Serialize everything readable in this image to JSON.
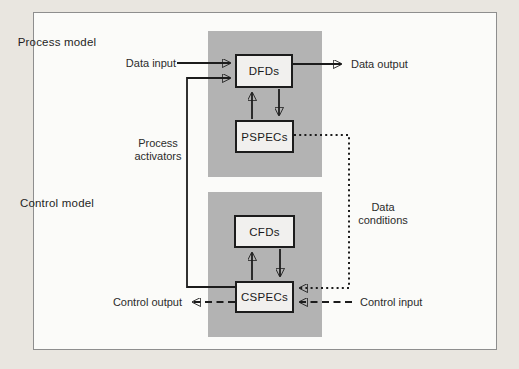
{
  "figure": {
    "type": "block-diagram",
    "panels": [
      {
        "id": "process",
        "title": "Process model",
        "boxes": [
          {
            "id": "dfds",
            "label": "DFDs"
          },
          {
            "id": "pspecs",
            "label": "PSPECs"
          }
        ]
      },
      {
        "id": "control",
        "title": "Control model",
        "boxes": [
          {
            "id": "cfds",
            "label": "CFDs"
          },
          {
            "id": "cspecs",
            "label": "CSPECs"
          }
        ]
      }
    ],
    "flow_labels": {
      "data_input": "Data input",
      "data_output": "Data output",
      "process_activators": "Process\nactivators",
      "data_conditions": "Data\nconditions",
      "control_output": "Control output",
      "control_input": "Control input"
    },
    "edges": [
      {
        "from": "Data input",
        "to": "DFDs",
        "style": "solid-arrow"
      },
      {
        "from": "DFDs",
        "to": "Data output",
        "style": "solid-arrow"
      },
      {
        "from": "PSPECs",
        "to": "DFDs",
        "style": "solid-arrow"
      },
      {
        "from": "DFDs",
        "to": "PSPECs",
        "style": "solid-arrow"
      },
      {
        "from": "CSPECs",
        "to": "DFDs",
        "style": "solid-arrow",
        "label": "Process activators"
      },
      {
        "from": "PSPECs",
        "to": "CSPECs",
        "style": "dotted-arrow",
        "label": "Data conditions"
      },
      {
        "from": "CSPECs",
        "to": "CFDs",
        "style": "solid-arrow"
      },
      {
        "from": "CFDs",
        "to": "CSPECs",
        "style": "solid-arrow"
      },
      {
        "from": "CSPECs",
        "to": "Control output",
        "style": "dashed-arrow"
      },
      {
        "from": "Control input",
        "to": "CSPECs",
        "style": "dashed-arrow"
      }
    ]
  },
  "colors": {
    "page_bg": "#e9e6e0",
    "figure_bg": "#fbfbf9",
    "figure_border": "#8e8e8e",
    "panel_gray": "#b3b3b3",
    "box_fill": "#f1f0ee",
    "line_black": "#1c1c1c",
    "text": "#2b2b2b"
  }
}
